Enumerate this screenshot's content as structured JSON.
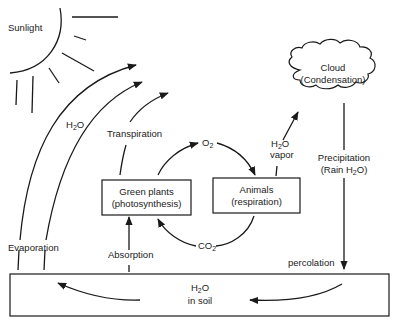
{
  "diagram": {
    "type": "water cycle",
    "labels": {
      "sunlight": "Sunlight",
      "h2o_evap": "H",
      "h2o_evap_sub": "2",
      "h2o_evap_tail": "O",
      "transpiration": "Transpiration",
      "evaporation": "Evaporation",
      "absorption": "Absorption",
      "o2": "O",
      "o2_sub": "2",
      "co2": "CO",
      "co2_sub": "2",
      "vapor_h": "H",
      "vapor_sub": "2",
      "vapor_o": "O",
      "vapor_word": "vapor",
      "precip_line1": "Precipitation",
      "precip_line2_a": "(Rain H",
      "precip_line2_sub": "2",
      "precip_line2_b": "O)",
      "percolation": "percolation",
      "soil_h": "H",
      "soil_sub": "2",
      "soil_o": "O",
      "soil_line2": "in soil"
    },
    "nodes": {
      "plants": {
        "line1": "Green plants",
        "line2": "(photosynthesis)"
      },
      "animals": {
        "line1": "Animals",
        "line2": "(respiration)"
      },
      "cloud": {
        "line1": "Cloud",
        "line2": "(Condensation)"
      },
      "soil": {
        "label": "H2O in soil"
      }
    },
    "edges": [
      {
        "from": "soil",
        "to": "atmosphere",
        "label": "Evaporation / H2O"
      },
      {
        "from": "plants",
        "to": "atmosphere",
        "label": "Transpiration"
      },
      {
        "from": "soil",
        "to": "plants",
        "label": "Absorption"
      },
      {
        "from": "plants",
        "to": "animals",
        "label": "O2"
      },
      {
        "from": "animals",
        "to": "plants",
        "label": "CO2"
      },
      {
        "from": "animals",
        "to": "cloud",
        "label": "H2O vapor"
      },
      {
        "from": "cloud",
        "to": "soil",
        "label": "Precipitation (Rain H2O)"
      },
      {
        "from": "precipitation",
        "to": "soil",
        "label": "percolation"
      }
    ]
  }
}
